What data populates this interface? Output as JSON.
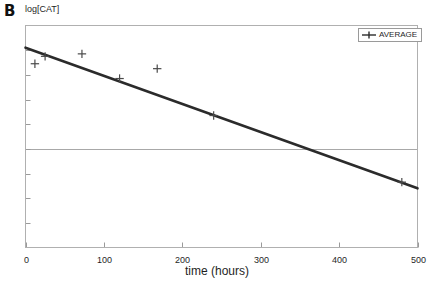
{
  "panel": {
    "label": "B"
  },
  "chart_data": {
    "type": "scatter",
    "title": "",
    "subtitle": "",
    "xlabel": "time (hours)",
    "ylabel": "log[CAT]",
    "xlim": [
      0,
      500
    ],
    "ylim": [
      0,
      9
    ],
    "xticks": [
      0,
      100,
      200,
      300,
      400,
      500
    ],
    "xtick_labels": [
      "0",
      "100",
      "200",
      "300",
      "400",
      "500"
    ],
    "yticks": [
      1,
      2,
      3,
      4,
      5,
      6,
      7,
      8
    ],
    "ytick_labels": [
      "",
      "",
      "",
      "",
      "",
      "",
      "",
      ""
    ],
    "grid": true,
    "gridlines_y": [
      4.0
    ],
    "legend": {
      "position": "top-right",
      "entries": [
        {
          "name": "AVERAGE",
          "marker": "plus",
          "line": "solid",
          "color": "#2b2b2b"
        }
      ]
    },
    "series": [
      {
        "name": "AVERAGE",
        "marker": "plus",
        "color": "#4a4a4a",
        "points": [
          {
            "x": 12,
            "y": 7.45
          },
          {
            "x": 25,
            "y": 7.75
          },
          {
            "x": 72,
            "y": 7.85
          },
          {
            "x": 120,
            "y": 6.85
          },
          {
            "x": 168,
            "y": 7.25
          },
          {
            "x": 240,
            "y": 5.35
          },
          {
            "x": 480,
            "y": 2.65
          }
        ]
      },
      {
        "name": "trendline",
        "type": "line",
        "color": "#2b2b2b",
        "points": [
          {
            "x": 0,
            "y": 8.1
          },
          {
            "x": 500,
            "y": 2.4
          }
        ]
      }
    ]
  }
}
